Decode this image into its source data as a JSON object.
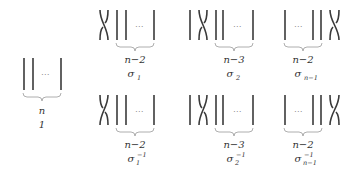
{
  "diagram": {
    "identity": {
      "count_label": "n",
      "name": "1"
    },
    "generators": [
      {
        "count_label": "n−2",
        "symbol": "σ",
        "index": "1",
        "exponent": ""
      },
      {
        "count_label": "n−3",
        "symbol": "σ",
        "index": "2",
        "exponent": ""
      },
      {
        "count_label": "n−2",
        "symbol": "σ",
        "index": "n−1",
        "exponent": ""
      }
    ],
    "inverses": [
      {
        "count_label": "n−2",
        "symbol": "σ",
        "index": "1",
        "exponent": "−1"
      },
      {
        "count_label": "n−3",
        "symbol": "σ",
        "index": "2",
        "exponent": "−1"
      },
      {
        "count_label": "n−2",
        "symbol": "σ",
        "index": "n−1",
        "exponent": "−1"
      }
    ],
    "ellipsis": "⋯"
  }
}
